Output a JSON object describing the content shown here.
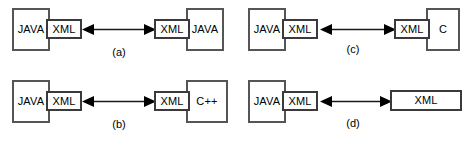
{
  "figure": {
    "stroke_color": "#4a4a4a",
    "background_color": "#ffffff",
    "arrow_color": "#1a1a1a"
  },
  "panels": [
    {
      "id": "a",
      "caption": "(a)",
      "left": {
        "lang": "JAVA",
        "adapter": "XML"
      },
      "right": {
        "adapter": "XML",
        "lang": "JAVA"
      },
      "arrow": "double-headed"
    },
    {
      "id": "b",
      "caption": "(b)",
      "left": {
        "lang": "JAVA",
        "adapter": "XML"
      },
      "right": {
        "adapter": "XML",
        "lang": "C++"
      },
      "arrow": "double-headed"
    },
    {
      "id": "c",
      "caption": "(c)",
      "left": {
        "lang": "JAVA",
        "adapter": "XML"
      },
      "right": {
        "adapter": "XML",
        "lang": "C"
      },
      "arrow": "double-headed"
    },
    {
      "id": "d",
      "caption": "(d)",
      "left": {
        "lang": "JAVA",
        "adapter": "XML"
      },
      "right": {
        "adapter": "XML"
      },
      "arrow": "double-headed"
    }
  ]
}
